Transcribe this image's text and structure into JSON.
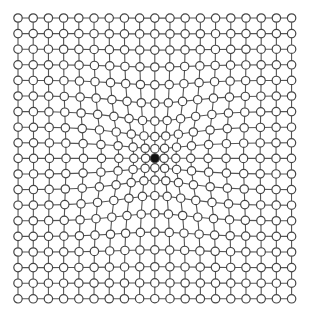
{
  "diagram": {
    "type": "lattice-grid",
    "rows": 19,
    "cols": 19,
    "origin": {
      "x": 18,
      "y": 18
    },
    "spacing": {
      "x": 15.2,
      "y": 15.6
    },
    "center_index": {
      "row": 9,
      "col": 9
    },
    "center_position": {
      "x": 155,
      "y": 158
    },
    "distortion": {
      "kind": "radial-pinch",
      "strength": 0.42,
      "sigma": 55
    },
    "node_radius": 4.2,
    "center_node_radius": 4.5,
    "colors": {
      "background": "#ffffff",
      "edge": "#555555",
      "node_fill": "#ffffff",
      "node_stroke": "#444444",
      "center_node_fill": "#111111"
    }
  }
}
